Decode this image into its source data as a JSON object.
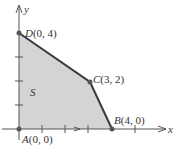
{
  "figure": {
    "region_label": "S",
    "axis_x_label": "x",
    "axis_y_label": "y",
    "vertices": [
      {
        "name": "A",
        "coords": "(0, 0)",
        "x": 0,
        "y": 0
      },
      {
        "name": "B",
        "coords": "(4, 0)",
        "x": 4,
        "y": 0
      },
      {
        "name": "C",
        "coords": "(3, 2)",
        "x": 3,
        "y": 2
      },
      {
        "name": "D",
        "coords": "(0, 4)",
        "x": 0,
        "y": 4
      }
    ],
    "colors": {
      "region_fill": "#d4d4d4",
      "edge": "#3a3a3a",
      "axis": "#555555",
      "vertex": "#555555"
    }
  }
}
